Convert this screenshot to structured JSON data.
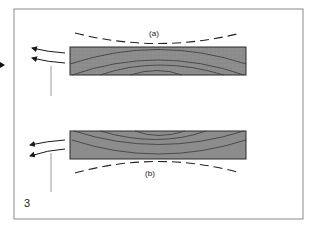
{
  "figure": {
    "number_label": "3",
    "frame_color": "#8a8a8a",
    "board_fill": "#8c8c8c",
    "board_stroke": "#2a2a2a",
    "grain_color": "#3a3a3a",
    "arrow_color": "#1a1a1a",
    "pointer_line_color": "#9a9a9a"
  },
  "panels": [
    {
      "label": "(a)",
      "description": "board with growth rings curving upward; dashed curve above, cupped downward"
    },
    {
      "label": "(b)",
      "description": "board with growth rings curving downward; dashed curve below, cupped upward"
    }
  ]
}
